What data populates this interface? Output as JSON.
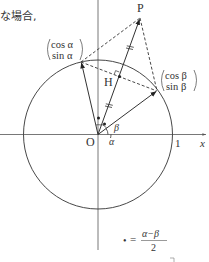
{
  "caption_fragment": "な場合,",
  "points": {
    "P": "P",
    "H": "H",
    "O": "O"
  },
  "axis": {
    "x_label": "x",
    "unit_tick": "1"
  },
  "angles": {
    "alpha": "α",
    "beta": "β"
  },
  "vector_a": {
    "top": "cos α",
    "bottom": "sin α"
  },
  "vector_b": {
    "top": "cos β",
    "bottom": "sin β"
  },
  "legend": {
    "symbol": "•",
    "equals": "=",
    "numerator": "α−β",
    "denominator": "2"
  }
}
